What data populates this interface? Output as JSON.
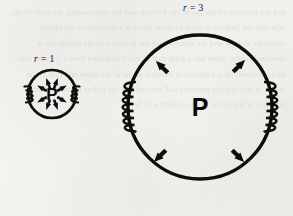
{
  "figure": {
    "caption_present": false,
    "background_color": "#f3f2ef",
    "ink_color": "#0b0a09",
    "bleed_through_text": "and the pressure of the gas in the balloon and the surrounding the ends of the tube that the balloon is such a rubber sheet is a function of the elastic constants and the and the quantity are the pressure of the membrane a stretched rubber sheet has a form that is when stretched over a circular tube an experiment by a a surface is a radius of the at the same and that as the radius is and that the pressure will decrease as the radius is and that the pressure of the of the of the system will be"
  },
  "vessels": [
    {
      "id": "small-vessel",
      "label": "P",
      "radius_label": {
        "variable": "r",
        "equals": "=",
        "value": "1"
      },
      "center": {
        "x": 52,
        "y": 94
      },
      "radius": 24,
      "stroke_width": 2.6,
      "coils": 2,
      "arrows": 8,
      "arrow_direction": "outward"
    },
    {
      "id": "large-vessel",
      "label": "P",
      "radius_label": {
        "variable": "r",
        "equals": "=",
        "value": "3"
      },
      "center": {
        "x": 200,
        "y": 107
      },
      "radius": 72,
      "stroke_width": 3.4,
      "coils": 2,
      "arrows": 4,
      "arrow_direction": "outward"
    }
  ],
  "labels": {
    "r1_text": "r = 1",
    "r3_text": "r = 3",
    "pressure_small": "P",
    "pressure_large": "P"
  }
}
